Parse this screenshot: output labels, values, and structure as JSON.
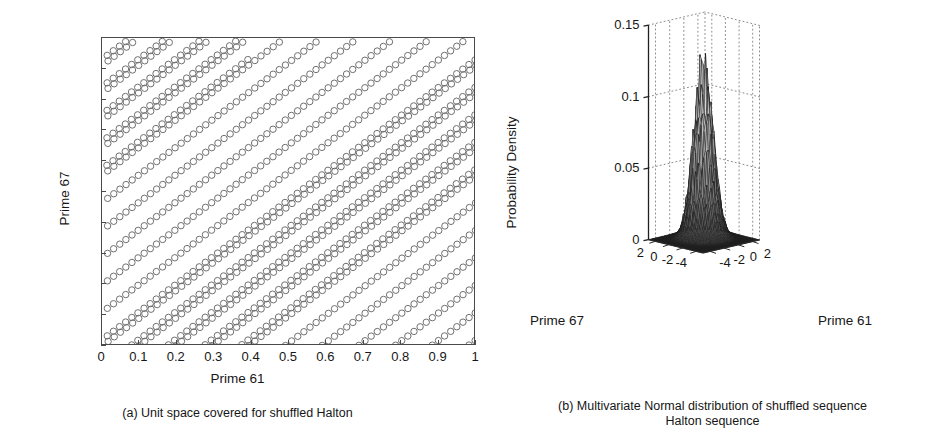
{
  "figure": {
    "background": "#ffffff",
    "ink": "#1a1a1a"
  },
  "panel_a": {
    "caption": "(a) Unit space covered for shuffled Halton",
    "xlabel": "Prime 61",
    "ylabel": "Prime 67",
    "marker": "open-circle"
  },
  "panel_b": {
    "caption_line1": "(b) Multivariate Normal distribution of shuffled sequence",
    "caption_line2": "Halton sequence",
    "xlabel": "Prime 61",
    "ylabel": "Prime 67",
    "zlabel": "Probability Density"
  },
  "chart_data": [
    {
      "type": "scatter",
      "id": "panel-a",
      "title": "(a) Unit space covered for shuffled Halton",
      "xlabel": "Prime 61",
      "ylabel": "Prime 67",
      "xlim": [
        0,
        1
      ],
      "ylim": [
        0,
        1
      ],
      "xticks": [
        0,
        0.1,
        0.2,
        0.3,
        0.4,
        0.5,
        0.6,
        0.7,
        0.8,
        0.9,
        1
      ],
      "yticks": [
        0,
        0.1,
        0.2,
        0.3,
        0.4,
        0.5,
        0.6,
        0.7,
        0.8,
        0.9,
        1
      ],
      "xtick_labels": [
        "0",
        "0.1",
        "0.2",
        "0.3",
        "0.4",
        "0.5",
        "0.6",
        "0.7",
        "0.8",
        "0.9",
        "1"
      ],
      "ytick_labels": [
        "0",
        "0.1",
        "0.2",
        "0.3",
        "0.4",
        "0.5",
        "0.6",
        "0.7",
        "0.8",
        "0.9",
        "1"
      ],
      "grid": false,
      "legend": "none",
      "marker_style": "open circle",
      "marker_size_px": 6.4,
      "point_count": 1000,
      "description": "Halton points (bases 61 and 67) lie on closely spaced parallel diagonal stripes of slope about 1.1, wrapping modulo 1; 23 stripes cross the unit square.",
      "generator": {
        "base_x": 61,
        "base_y": 67,
        "n_points": 1000,
        "stripe_slope": 1.0984,
        "stripe_spacing": 0.0435,
        "step_x": 0.01639,
        "step_y": 0.01493
      }
    },
    {
      "type": "surface",
      "id": "panel-b",
      "title": "(b) Multivariate Normal distribution of shuffled sequence Halton sequence",
      "xlabel": "Prime 61",
      "ylabel": "Prime 67",
      "zlabel": "Probability Density",
      "xlim": [
        -5,
        3
      ],
      "ylim": [
        -5,
        3
      ],
      "zlim": [
        0,
        0.15
      ],
      "xticks": [
        -4,
        -2,
        0,
        2
      ],
      "yticks": [
        -4,
        -2,
        0,
        2
      ],
      "zticks": [
        0,
        0.05,
        0.1,
        0.15
      ],
      "xtick_labels": [
        "-4",
        "-2",
        "0",
        "2"
      ],
      "ytick_labels": [
        "-4",
        "-2",
        "0",
        "2"
      ],
      "ztick_labels": [
        "0",
        "0.05",
        "0.1",
        "0.15"
      ],
      "grid": true,
      "grid_style": "dotted",
      "legend": "none",
      "colormap": "gray",
      "peak_value": 0.112,
      "peak_x": -0.4,
      "peak_y": -0.3,
      "mesh_n": 41,
      "sigma_x": 1.0,
      "sigma_y": 1.0,
      "noise_amplitude": 0.22,
      "description": "Bivariate normal probability density surface with a single sharp noisy peak near the origin reaching about 0.11, falling to a flat dark plane near 0 across the rest of the -5..3 domain."
    }
  ]
}
